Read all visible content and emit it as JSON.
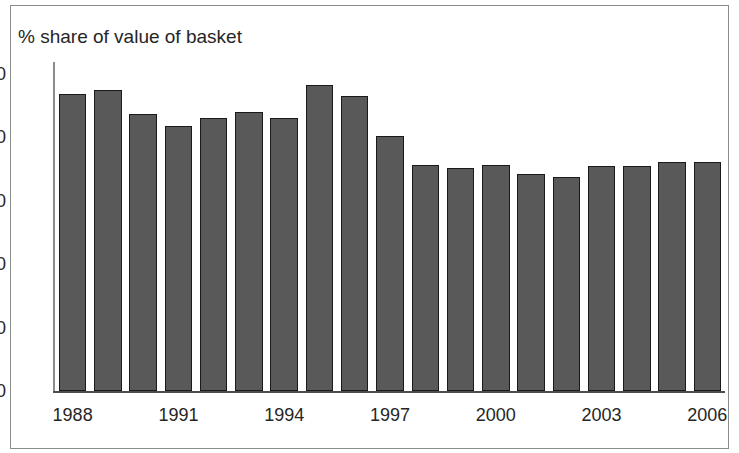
{
  "figure": {
    "title": "% share of value of basket",
    "border_color": "#8c8c8c",
    "background": "#ffffff"
  },
  "chart_data": {
    "type": "bar",
    "title": "% share of value of basket",
    "xlabel": "",
    "ylabel": "",
    "ylim": [
      0,
      50
    ],
    "yticks": [
      "0",
      "10",
      "20",
      "30",
      "40",
      "50"
    ],
    "ytick_values": [
      0,
      10,
      20,
      30,
      40,
      50
    ],
    "grid": false,
    "legend": "none",
    "bar_fill_color": "#595959",
    "bar_edge_color": "#1a1a1a",
    "categories": [
      "1988",
      "1989",
      "1990",
      "1991",
      "1992",
      "1993",
      "1994",
      "1995",
      "1996",
      "1997",
      "1998",
      "1999",
      "2000",
      "2001",
      "2002",
      "2003",
      "2004",
      "2005",
      "2006"
    ],
    "values": [
      46.8,
      47.5,
      43.7,
      41.8,
      43.0,
      44.0,
      43.0,
      48.2,
      46.5,
      40.2,
      35.6,
      35.2,
      35.6,
      34.3,
      33.7,
      35.5,
      35.5,
      36.2,
      36.2
    ],
    "xtick_labels": [
      "1988",
      "1991",
      "1994",
      "1997",
      "2000",
      "2003",
      "2006"
    ],
    "xtick_categories": [
      "1988",
      "1991",
      "1994",
      "1997",
      "2000",
      "2003",
      "2006"
    ]
  }
}
